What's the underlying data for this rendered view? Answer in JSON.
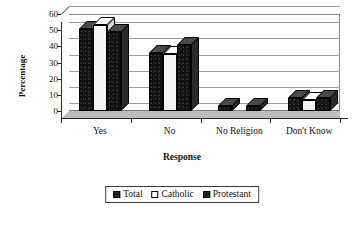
{
  "chart_data": {
    "type": "bar",
    "title": "",
    "xlabel": "Response",
    "ylabel": "Percentage",
    "categories": [
      "Yes",
      "No",
      "No Religion",
      "Don't Know"
    ],
    "series": [
      {
        "name": "Total",
        "values": [
          51,
          36,
          3,
          8
        ]
      },
      {
        "name": "Catholic",
        "values": [
          53,
          35,
          0,
          7
        ]
      },
      {
        "name": "Protestant",
        "values": [
          49,
          41,
          3,
          8
        ]
      }
    ],
    "ylim": [
      0,
      60
    ],
    "yticks": [
      0,
      10,
      20,
      30,
      40,
      50,
      60
    ],
    "ytick_labels": [
      "0",
      "10",
      "20",
      "30",
      "40",
      "50",
      "60"
    ],
    "grid": true,
    "legend_position": "bottom",
    "style": "3d-bar",
    "colors": {
      "total": "#111111",
      "catholic": "#ffffff",
      "protestant": "#111111",
      "axis": "#2a2a2a",
      "gridline": "#9a9a9a",
      "plot_background": "#ffffff",
      "floor": "#bdbdbd"
    }
  },
  "legend": {
    "items": [
      {
        "label": "Total",
        "swatch": "dark"
      },
      {
        "label": "Catholic",
        "swatch": "light"
      },
      {
        "label": "Protestant",
        "swatch": "dark"
      }
    ]
  }
}
